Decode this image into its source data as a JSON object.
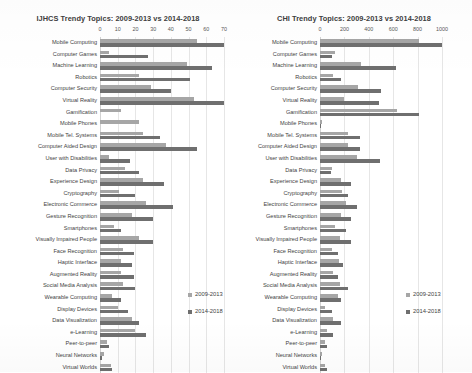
{
  "chart_data": [
    {
      "type": "bar",
      "orientation": "horizontal",
      "title": "IJHCS Trendy Topics: 2009-2013 vs 2014-2018",
      "xlabel": "",
      "ylabel": "",
      "xlim": [
        0,
        70
      ],
      "xticks": [
        0,
        10,
        20,
        30,
        40,
        50,
        60,
        70
      ],
      "grid": true,
      "legend_position": "bottom-right",
      "categories": [
        "Mobile Computing",
        "Computer Games",
        "Machine Learning",
        "Robotics",
        "Computer Security",
        "Virtual Reality",
        "Gamification",
        "Mobile Phones",
        "Mobile Tel. Systems",
        "Computer Aided Design",
        "User with Disabilities",
        "Data Privacy",
        "Experience Design",
        "Cryptography",
        "Electronic Commerce",
        "Gesture Recognition",
        "Smartphones",
        "Visually Impaired People",
        "Face Recognition",
        "Haptic Interface",
        "Augmented Reality",
        "Social Media Analysis",
        "Wearable Computing",
        "Display Devices",
        "Data Visualization",
        "e-Learning",
        "Peer-to-peer",
        "Neural Networks",
        "Virtual Worlds"
      ],
      "series": [
        {
          "name": "2009-2013",
          "color": "#a6a6a6",
          "values": [
            55,
            5,
            49,
            22,
            29,
            53,
            12,
            22,
            24,
            37,
            5,
            14,
            24,
            11,
            26,
            18,
            8,
            22,
            13,
            12,
            12,
            13,
            7,
            10,
            18,
            20,
            4,
            2,
            6
          ]
        },
        {
          "name": "2014-2018",
          "color": "#6f6f6f",
          "values": [
            70,
            27,
            63,
            51,
            40,
            70,
            0,
            0,
            34,
            55,
            17,
            22,
            36,
            20,
            41,
            30,
            12,
            30,
            19,
            18,
            19,
            20,
            12,
            16,
            22,
            26,
            5,
            1,
            7
          ]
        }
      ]
    },
    {
      "type": "bar",
      "orientation": "horizontal",
      "title": "CHI Trendy Topics: 2009-2013 vs 2014-2018",
      "xlabel": "",
      "ylabel": "",
      "xlim": [
        0,
        1000
      ],
      "xticks": [
        0,
        200,
        400,
        600,
        800,
        1000
      ],
      "grid": true,
      "legend_position": "bottom-right",
      "categories": [
        "Mobile Computing",
        "Computer Games",
        "Machine Learning",
        "Robotics",
        "Computer Security",
        "Virtual Reality",
        "Gamification",
        "Mobile Phones",
        "Mobile Tel. Systems",
        "Computer Aided Design",
        "User with Disabilities",
        "Data Privacy",
        "Experience Design",
        "Cryptography",
        "Electronic Commerce",
        "Gesture Recognition",
        "Smartphones",
        "Visually Impaired People",
        "Face Recognition",
        "Haptic Interface",
        "Augmented Reality",
        "Social Media Analysis",
        "Wearable Computing",
        "Display Devices",
        "Data Visualization",
        "e-Learning",
        "Peer-to-peer",
        "Neural Networks",
        "Virtual Worlds"
      ],
      "series": [
        {
          "name": "2009-2013",
          "color": "#a6a6a6",
          "values": [
            810,
            120,
            340,
            110,
            310,
            200,
            630,
            20,
            230,
            230,
            300,
            95,
            170,
            180,
            215,
            170,
            120,
            160,
            95,
            155,
            105,
            160,
            145,
            40,
            110,
            60,
            45,
            14,
            40
          ]
        },
        {
          "name": "2014-2018",
          "color": "#6f6f6f",
          "values": [
            1000,
            95,
            620,
            175,
            500,
            480,
            810,
            10,
            330,
            330,
            490,
            90,
            255,
            230,
            300,
            250,
            215,
            250,
            150,
            185,
            150,
            230,
            170,
            95,
            175,
            105,
            55,
            12,
            60
          ]
        }
      ]
    }
  ],
  "legend": {
    "items": [
      {
        "label": "2009-2013",
        "color": "#a6a6a6"
      },
      {
        "label": "2014-2018",
        "color": "#6f6f6f"
      }
    ]
  }
}
